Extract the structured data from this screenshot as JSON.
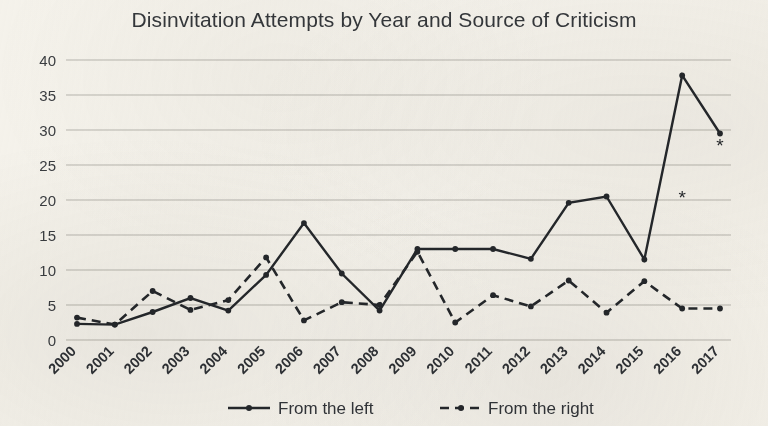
{
  "chart_data": {
    "type": "line",
    "title": "Disinvitation Attempts by Year and Source of Criticism",
    "xlabel": "",
    "ylabel": "",
    "ylim": [
      0,
      40
    ],
    "yticks": [
      0,
      5,
      10,
      15,
      20,
      25,
      30,
      35,
      40
    ],
    "grid": true,
    "legend_position": "bottom",
    "categories": [
      "2000",
      "2001",
      "2002",
      "2003",
      "2004",
      "2005",
      "2006",
      "2007",
      "2008",
      "2009",
      "2010",
      "2011",
      "2012",
      "2013",
      "2014",
      "2015",
      "2016",
      "2017"
    ],
    "series": [
      {
        "name": "From the left",
        "style": "solid",
        "color": "#25282c",
        "marker": "dot",
        "values": [
          2.3,
          2.2,
          4.0,
          6.0,
          4.2,
          9.3,
          16.7,
          9.5,
          4.2,
          13.0,
          13.0,
          13.0,
          11.6,
          19.6,
          20.5,
          11.5,
          37.8,
          29.5
        ]
      },
      {
        "name": "From the right",
        "style": "dashed",
        "color": "#25282c",
        "marker": "dot",
        "values": [
          3.2,
          2.2,
          7.0,
          4.3,
          5.7,
          11.8,
          2.8,
          5.4,
          5.0,
          12.6,
          2.5,
          6.4,
          4.8,
          8.5,
          3.9,
          8.4,
          4.5,
          4.5
        ]
      }
    ],
    "annotations": [
      {
        "text": "*",
        "x_value": "2016",
        "y_value": 19.5,
        "name": "asterisk-2016"
      },
      {
        "text": "*",
        "x_value": "2017",
        "y_value": 26.8,
        "name": "asterisk-2017"
      }
    ]
  },
  "legend": {
    "items": [
      {
        "label": "From the left",
        "style": "solid"
      },
      {
        "label": "From the right",
        "style": "dashed"
      }
    ]
  },
  "colors": {
    "background": "#f6f4ef",
    "ink": "#25282c",
    "grid": "#b9b7b1",
    "title": "#35383c"
  }
}
